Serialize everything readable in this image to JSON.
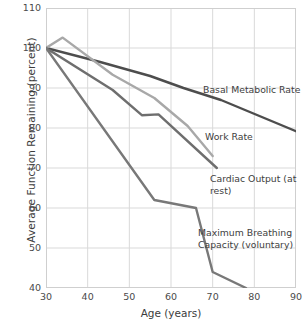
{
  "chart_data": {
    "type": "line",
    "title": "",
    "xlabel": "Age (years)",
    "ylabel": "Average Function Remaining (percent)",
    "xlim": [
      30,
      90
    ],
    "ylim": [
      40,
      110
    ],
    "xticks": [
      30,
      40,
      50,
      60,
      70,
      80,
      90
    ],
    "yticks": [
      40,
      50,
      60,
      70,
      80,
      90,
      100,
      110
    ],
    "grid": true,
    "legend_position": "inline-annotations",
    "series": [
      {
        "name": "Basal Metabolic Rate",
        "color": "#4d4d4d",
        "x": [
          30,
          43,
          55,
          63,
          72,
          90
        ],
        "values": [
          100,
          96.5,
          93,
          90,
          87,
          79.2
        ]
      },
      {
        "name": "Work Rate",
        "color": "#a8a8a8",
        "x": [
          30,
          34,
          46,
          56,
          64,
          70
        ],
        "values": [
          100,
          102.6,
          93.3,
          87.5,
          80.5,
          73
        ]
      },
      {
        "name": "Cardiac Output (at rest)",
        "color": "#6e6e6e",
        "x": [
          30,
          46,
          53,
          57,
          71
        ],
        "values": [
          100,
          89.5,
          83.2,
          83.4,
          70
        ]
      },
      {
        "name": "Maximum Breathing Capacity (voluntary)",
        "color": "#787878",
        "x": [
          30,
          56,
          66,
          70,
          78
        ],
        "values": [
          100,
          62,
          60,
          44,
          40
        ]
      }
    ],
    "annotations": [
      {
        "text": "Basal Metabolic Rate",
        "x_px": 203,
        "y_px": 84
      },
      {
        "text": "Work Rate",
        "x_px": 205,
        "y_px": 131
      },
      {
        "text": "Cardiac Output (at rest)",
        "x_px": 210,
        "y_px": 173
      },
      {
        "text": "Maximum Breathing\nCapacity (voluntary)",
        "x_px": 198,
        "y_px": 227
      }
    ]
  },
  "style": {
    "grid_color": "#d9d9d9",
    "axis_color": "#cfcfcf",
    "text_color": "#3c3c3c",
    "background": "#ffffff"
  }
}
